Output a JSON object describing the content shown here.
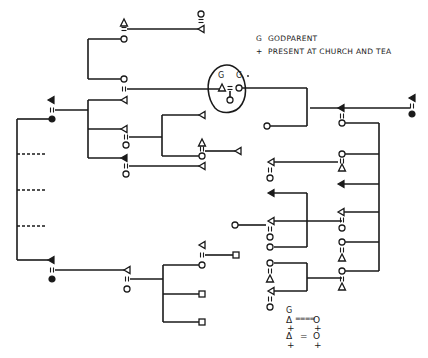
{
  "legend": {
    "items": [
      {
        "symbol": "G",
        "label": "GODPARENT"
      },
      {
        "symbol": "+",
        "label": "PRESENT AT CHURCH AND TEA"
      }
    ]
  },
  "center_group": {
    "godparent_marks": [
      "G",
      "G"
    ]
  },
  "key_block": {
    "row1": "G",
    "row2_left": "Δ",
    "row2_mid": "====",
    "row2_right": "O",
    "row3_left": "+",
    "row3_right": "+",
    "row4_left": "Δ",
    "row4_mid": "=",
    "row4_right": "O",
    "row5_left": "+",
    "row5_right": "+"
  },
  "colors": {
    "ink": "#1a1a1a",
    "background": "#ffffff"
  }
}
